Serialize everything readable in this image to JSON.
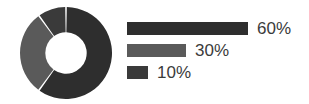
{
  "chart_data": {
    "type": "pie",
    "variant": "donut",
    "title": "",
    "subtitle": "",
    "xlabel": "",
    "ylabel": "",
    "grid": false,
    "legend_position": "right",
    "legend_style": "proportional-bars",
    "units": "percent",
    "start_angle_deg": 0,
    "direction": "clockwise",
    "inner_radius_ratio": 0.45,
    "slice_gap_deg": 2,
    "categories": [
      "60%",
      "30%",
      "10%"
    ],
    "values": [
      60,
      30,
      10
    ],
    "labels": [
      "60%",
      "30%",
      "10%"
    ],
    "colors": [
      "#2e2e2e",
      "#5a5a5a",
      "#3a3a3a"
    ],
    "slices": [
      {
        "label": "60%",
        "value": 60,
        "color": "#2e2e2e",
        "bar_length_px": 121
      },
      {
        "label": "30%",
        "value": 30,
        "color": "#5a5a5a",
        "bar_length_px": 59
      },
      {
        "label": "10%",
        "value": 10,
        "color": "#3a3a3a",
        "bar_length_px": 21
      }
    ]
  },
  "colors": {
    "background": "#ffffff",
    "text": "#3b3b3b",
    "slice_dark": "#2e2e2e",
    "slice_gray": "#5a5a5a",
    "slice_dark_small": "#3a3a3a",
    "divider": "#ffffff"
  },
  "legend": {
    "rows": [
      {
        "label": "60%",
        "color": "#2e2e2e",
        "bar_length_px": 121
      },
      {
        "label": "30%",
        "color": "#5a5a5a",
        "bar_length_px": 59
      },
      {
        "label": "10%",
        "color": "#3a3a3a",
        "bar_length_px": 21
      }
    ]
  }
}
